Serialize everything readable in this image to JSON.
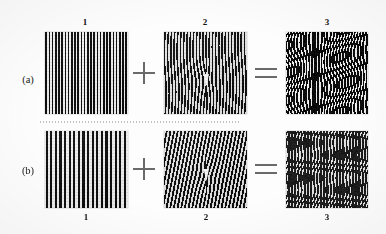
{
  "figure": {
    "background_color": "#fdfdfd",
    "ink_color": "#111111",
    "operator_color": "#6a6a6a"
  },
  "rows": [
    {
      "id": "a",
      "label": "(a)",
      "label_position": "left",
      "number_label_position": "top",
      "panels": [
        {
          "number": "1",
          "kind": "vertical-grating",
          "description": "high-frequency vertical square-wave grating",
          "period_px": 3.2,
          "tilt_deg": 0,
          "curvature": 0,
          "background": "#f0f0f0",
          "bar_color": "#101010"
        },
        {
          "number": "2",
          "kind": "vertical-grating-distorted",
          "description": "vertical grating with a small central phase distortion / defect",
          "period_px": 3.2,
          "tilt_deg": 0,
          "curvature": 0,
          "background": "#e8e8e8",
          "bar_color": "#151515"
        },
        {
          "number": "3",
          "kind": "moire-zigzag",
          "description": "superposition result: dark moire with V / zigzag structures",
          "period_px": 3.0,
          "tilt_deg": 0,
          "curvature": 0,
          "background": "#0d0d0d",
          "bar_color": "#ffffff"
        }
      ],
      "operators": [
        "+",
        "="
      ]
    },
    {
      "id": "b",
      "label": "(b)",
      "label_position": "left",
      "number_label_position": "bottom",
      "panels": [
        {
          "number": "1",
          "kind": "vertical-grating",
          "description": "lower-frequency vertical square-wave grating",
          "period_px": 4.6,
          "tilt_deg": 0,
          "curvature": 0,
          "background": "#f0f0f0",
          "bar_color": "#101010"
        },
        {
          "number": "2",
          "kind": "tilted-grating-distorted",
          "description": "grating tilted about 11 degrees with small central defect",
          "period_px": 3.6,
          "tilt_deg": 11,
          "curvature": 0,
          "background": "#e6e6e6",
          "bar_color": "#141414"
        },
        {
          "number": "3",
          "kind": "moire-horizontal-bands",
          "description": "superposition result: horizontal moire beat bands",
          "period_px": 3.2,
          "tilt_deg": 0,
          "band_period_px": 9,
          "background": "#0b0b0b",
          "bar_color": "#ffffff"
        }
      ],
      "operators": [
        "+",
        "="
      ]
    }
  ],
  "operators": {
    "plus": "+",
    "equals": "="
  }
}
